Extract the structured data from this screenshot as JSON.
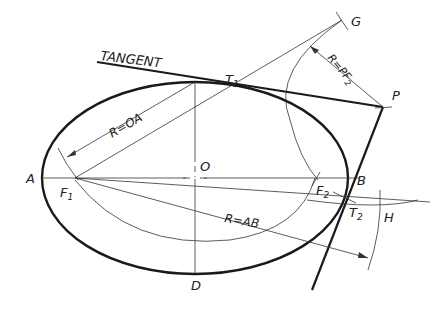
{
  "diagram": {
    "colors": {
      "ink": "#1a1a1a",
      "thin": "#333333",
      "background": "#ffffff"
    },
    "labels": {
      "tangent": "TANGENT",
      "t1": "T",
      "t1_sub": "1",
      "t2": "T",
      "t2_sub": "2",
      "g": "G",
      "p": "P",
      "a": "A",
      "b": "B",
      "o": "O",
      "d": "D",
      "h": "H",
      "f1": "F",
      "f1_sub": "1",
      "f2": "F",
      "f2_sub": "2",
      "r_oa": "R=OA",
      "r_pf2": "R=PF",
      "r_pf2_sub": "2",
      "r_ab": "R=AB"
    },
    "points": {
      "A": [
        42,
        178
      ],
      "B": [
        348,
        178
      ],
      "O": [
        195,
        178
      ],
      "D": [
        195,
        273
      ],
      "F1": [
        75,
        178
      ],
      "F2": [
        315,
        178
      ],
      "T1": [
        233,
        87
      ],
      "T2": [
        332,
        210
      ],
      "P": [
        383,
        107
      ],
      "G": [
        342,
        20
      ],
      "H": [
        425,
        192
      ]
    }
  }
}
